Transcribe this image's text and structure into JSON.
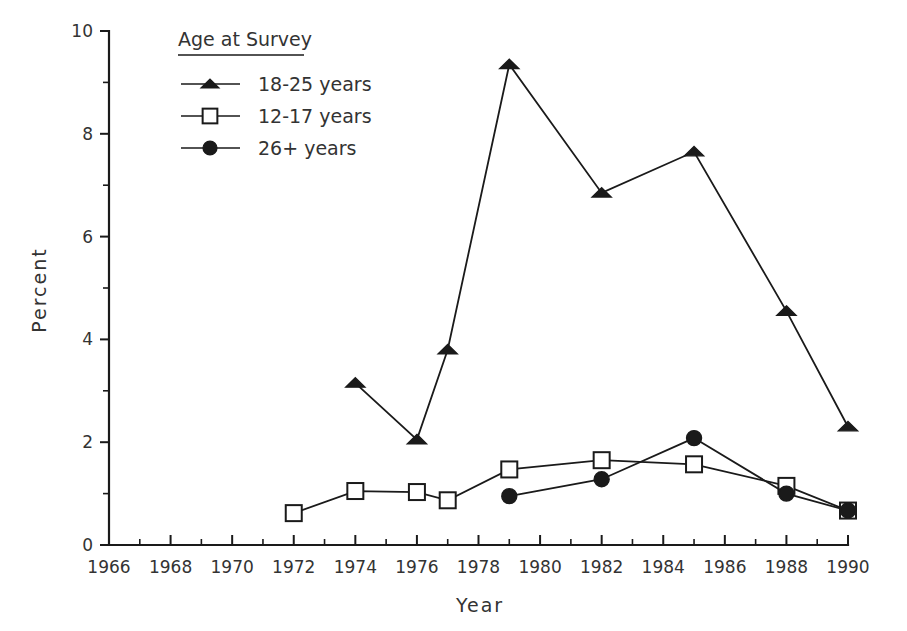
{
  "chart_data": {
    "type": "line",
    "title": "",
    "xlabel": "Year",
    "ylabel": "Percent",
    "xlim": [
      1966,
      1990
    ],
    "ylim": [
      0,
      10
    ],
    "grid": false,
    "legend_position": "top-left",
    "legend_title": "Age at Survey",
    "x_ticks_major": [
      1966,
      1968,
      1970,
      1972,
      1974,
      1976,
      1978,
      1980,
      1982,
      1984,
      1986,
      1988,
      1990
    ],
    "x_ticks_minor": [
      1967,
      1969,
      1971,
      1973,
      1975,
      1977,
      1979,
      1981,
      1983,
      1985,
      1987,
      1989
    ],
    "x_tick_labels": [
      "1966",
      "1968",
      "1970",
      "1972",
      "1974",
      "1976",
      "1978",
      "1980",
      "1982",
      "1984",
      "1986",
      "1988",
      "1990"
    ],
    "y_ticks_major": [
      0,
      2,
      4,
      6,
      8,
      10
    ],
    "y_ticks_minor": [
      1,
      3,
      5,
      7,
      9
    ],
    "y_tick_labels": [
      "0",
      "2",
      "4",
      "6",
      "8",
      "10"
    ],
    "series": [
      {
        "name": "18-25 years",
        "marker": "triangle-filled",
        "x": [
          1974,
          1976,
          1977,
          1979,
          1982,
          1985,
          1988,
          1990
        ],
        "values": [
          3.15,
          2.05,
          3.8,
          9.35,
          6.85,
          7.65,
          4.55,
          2.3
        ]
      },
      {
        "name": "12-17 years",
        "marker": "square-open",
        "x": [
          1972,
          1974,
          1976,
          1977,
          1979,
          1982,
          1985,
          1988,
          1990
        ],
        "values": [
          0.62,
          1.05,
          1.03,
          0.87,
          1.47,
          1.65,
          1.57,
          1.15,
          0.67
        ]
      },
      {
        "name": "26+ years",
        "marker": "circle-filled",
        "x": [
          1979,
          1982,
          1985,
          1988,
          1990
        ],
        "values": [
          0.95,
          1.28,
          2.08,
          1.0,
          0.67
        ]
      }
    ]
  },
  "legend": {
    "title": "Age at Survey",
    "entries": [
      {
        "label": "18-25 years",
        "marker": "triangle-filled"
      },
      {
        "label": "12-17 years",
        "marker": "square-open"
      },
      {
        "label": "26+ years",
        "marker": "circle-filled"
      }
    ]
  },
  "colors": {
    "ink": "#1a1a1a",
    "text": "#333333",
    "background": "#ffffff"
  }
}
